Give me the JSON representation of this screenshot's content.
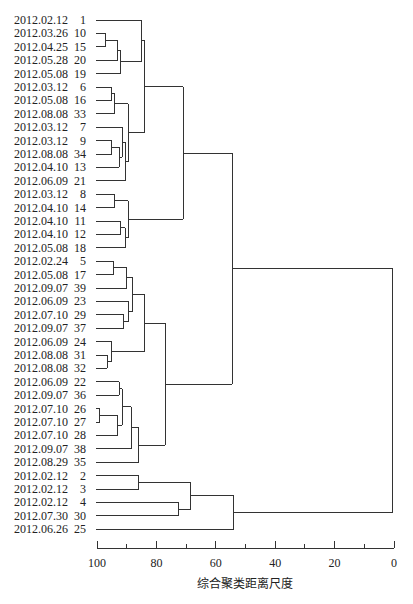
{
  "chart_data": {
    "type": "dendrogram",
    "title": "",
    "xlabel": "综合聚类距离尺度",
    "ylabel": "",
    "xlim": [
      100,
      0
    ],
    "xticks": [
      100,
      80,
      60,
      40,
      20,
      0
    ],
    "minor_ticks": [
      90,
      70,
      50,
      30,
      10
    ],
    "leaves": [
      {
        "date": "2012.02.12",
        "id": "1"
      },
      {
        "date": "2012.03.26",
        "id": "10"
      },
      {
        "date": "2012.04.25",
        "id": "15"
      },
      {
        "date": "2012.05.28",
        "id": "20"
      },
      {
        "date": "2012.05.08",
        "id": "19"
      },
      {
        "date": "2012.03.12",
        "id": "6"
      },
      {
        "date": "2012.05.08",
        "id": "16"
      },
      {
        "date": "2012.08.08",
        "id": "33"
      },
      {
        "date": "2012.03.12",
        "id": "7"
      },
      {
        "date": "2012.03.12",
        "id": "9"
      },
      {
        "date": "2012.08.08",
        "id": "34"
      },
      {
        "date": "2012.04.10",
        "id": "13"
      },
      {
        "date": "2012.06.09",
        "id": "21"
      },
      {
        "date": "2012.03.12",
        "id": "8"
      },
      {
        "date": "2012.04.10",
        "id": "14"
      },
      {
        "date": "2012.04.10",
        "id": "11"
      },
      {
        "date": "2012.04.10",
        "id": "12"
      },
      {
        "date": "2012.05.08",
        "id": "18"
      },
      {
        "date": "2012.02.24",
        "id": "5"
      },
      {
        "date": "2012.05.08",
        "id": "17"
      },
      {
        "date": "2012.09.07",
        "id": "39"
      },
      {
        "date": "2012.06.09",
        "id": "23"
      },
      {
        "date": "2012.07.10",
        "id": "29"
      },
      {
        "date": "2012.09.07",
        "id": "37"
      },
      {
        "date": "2012.06.09",
        "id": "24"
      },
      {
        "date": "2012.08.08",
        "id": "31"
      },
      {
        "date": "2012.08.08",
        "id": "32"
      },
      {
        "date": "2012.06.09",
        "id": "22"
      },
      {
        "date": "2012.09.07",
        "id": "36"
      },
      {
        "date": "2012.07.10",
        "id": "26"
      },
      {
        "date": "2012.07.10",
        "id": "27"
      },
      {
        "date": "2012.07.10",
        "id": "28"
      },
      {
        "date": "2012.09.07",
        "id": "38"
      },
      {
        "date": "2012.08.29",
        "id": "35"
      },
      {
        "date": "2012.02.12",
        "id": "2"
      },
      {
        "date": "2012.02.12",
        "id": "3"
      },
      {
        "date": "2012.02.12",
        "id": "4"
      },
      {
        "date": "2012.07.30",
        "id": "30"
      },
      {
        "date": "2012.06.26",
        "id": "25"
      }
    ],
    "merges": [
      {
        "a": "L1",
        "b": "L2",
        "dist": 97,
        "id": "m_10_15"
      },
      {
        "a": "m_10_15",
        "b": "L3",
        "dist": 93,
        "id": "m_10_20"
      },
      {
        "a": "m_10_20",
        "b": "L4",
        "dist": 92,
        "id": "m_10_19"
      },
      {
        "a": "L0",
        "b": "m_10_19",
        "dist": 85,
        "id": "m_1_19"
      },
      {
        "a": "L5",
        "b": "L6",
        "dist": 95,
        "id": "m_6_16"
      },
      {
        "a": "m_6_16",
        "b": "L7",
        "dist": 94,
        "id": "m_6_33"
      },
      {
        "a": "L9",
        "b": "L10",
        "dist": 95,
        "id": "m_9_34"
      },
      {
        "a": "m_9_34",
        "b": "L11",
        "dist": 92.5,
        "id": "m_9_13"
      },
      {
        "a": "L8",
        "b": "m_9_13",
        "dist": 91.5,
        "id": "m_7_13"
      },
      {
        "a": "m_7_13",
        "b": "L12",
        "dist": 90.5,
        "id": "m_7_21"
      },
      {
        "a": "m_6_33",
        "b": "m_7_21",
        "dist": 89.5,
        "id": "m_6_21"
      },
      {
        "a": "m_1_19",
        "b": "m_6_21",
        "dist": 84,
        "id": "m_1_21"
      },
      {
        "a": "L13",
        "b": "L14",
        "dist": 94,
        "id": "m_8_14"
      },
      {
        "a": "L15",
        "b": "L16",
        "dist": 92,
        "id": "m_11_12"
      },
      {
        "a": "m_11_12",
        "b": "L17",
        "dist": 90.5,
        "id": "m_11_18"
      },
      {
        "a": "m_8_14",
        "b": "m_11_18",
        "dist": 89.5,
        "id": "m_8_18"
      },
      {
        "a": "m_1_21",
        "b": "m_8_18",
        "dist": 71,
        "id": "cluster_A"
      },
      {
        "a": "L18",
        "b": "L19",
        "dist": 94.5,
        "id": "m_5_17"
      },
      {
        "a": "m_5_17",
        "b": "L20",
        "dist": 90,
        "id": "m_5_39"
      },
      {
        "a": "L22",
        "b": "L23",
        "dist": 91,
        "id": "m_29_37"
      },
      {
        "a": "L21",
        "b": "m_29_37",
        "dist": 89.5,
        "id": "m_23_37"
      },
      {
        "a": "m_5_39",
        "b": "m_23_37",
        "dist": 88,
        "id": "m_5_37"
      },
      {
        "a": "L25",
        "b": "L26",
        "dist": 96.5,
        "id": "m_31_32"
      },
      {
        "a": "L24",
        "b": "m_31_32",
        "dist": 95,
        "id": "m_24_32"
      },
      {
        "a": "m_5_37",
        "b": "m_24_32",
        "dist": 84,
        "id": "m_5_32"
      },
      {
        "a": "L27",
        "b": "L28",
        "dist": 92.5,
        "id": "m_22_36"
      },
      {
        "a": "L29",
        "b": "L30",
        "dist": 99,
        "id": "m_26_27"
      },
      {
        "a": "m_26_27",
        "b": "L31",
        "dist": 93,
        "id": "m_26_28"
      },
      {
        "a": "m_22_36",
        "b": "m_26_28",
        "dist": 91.5,
        "id": "m_22_28"
      },
      {
        "a": "m_22_28",
        "b": "L32",
        "dist": 88.5,
        "id": "m_22_38"
      },
      {
        "a": "m_22_38",
        "b": "L33",
        "dist": 86,
        "id": "m_22_35"
      },
      {
        "a": "m_5_32",
        "b": "m_22_35",
        "dist": 77,
        "id": "cluster_B"
      },
      {
        "a": "cluster_A",
        "b": "cluster_B",
        "dist": 54.5,
        "id": "cluster_AB"
      },
      {
        "a": "L34",
        "b": "L35",
        "dist": 86,
        "id": "m_2_3"
      },
      {
        "a": "L36",
        "b": "L37",
        "dist": 72.5,
        "id": "m_4_30"
      },
      {
        "a": "m_2_3",
        "b": "m_4_30",
        "dist": 68.5,
        "id": "m_2_30"
      },
      {
        "a": "m_2_30",
        "b": "L38",
        "dist": 54,
        "id": "cluster_C"
      },
      {
        "a": "cluster_AB",
        "b": "cluster_C",
        "dist": 0.5,
        "id": "root"
      }
    ]
  }
}
